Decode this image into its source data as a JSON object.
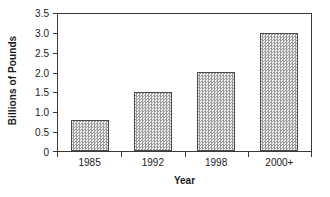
{
  "chart_data": {
    "type": "bar",
    "title": "",
    "subtitle": "",
    "xlabel": "Year",
    "ylabel": "Billions of Pounds",
    "categories": [
      "1985",
      "1992",
      "1998",
      "2000+"
    ],
    "values": [
      0.78,
      1.52,
      2.02,
      3.02
    ],
    "series": [
      {
        "name": "Billions of Pounds",
        "values": [
          0.78,
          1.52,
          2.02,
          3.02
        ]
      }
    ],
    "ylim": [
      0,
      3.5
    ],
    "ytick_labels": [
      "3.5",
      "3.0",
      "2.5",
      "2.0",
      "1.5",
      "1.0",
      "0.5",
      "0"
    ],
    "ytick_values": [
      3.5,
      3.0,
      2.5,
      2.0,
      1.5,
      1.0,
      0.5,
      0
    ],
    "grid": false,
    "legend": false,
    "legend_position": "none",
    "annotations": [],
    "colors": {
      "bar_fill_light": "#f2f2f2",
      "bar_fill_dark": "#9a9a9a",
      "bar_border": "#4a4a4a",
      "axis": "#3a3a3a",
      "text": "#1a1a1a",
      "background": "#ffffff"
    }
  }
}
